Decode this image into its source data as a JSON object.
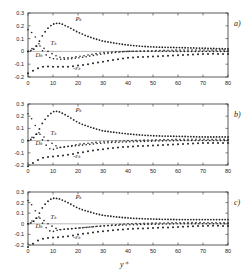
{
  "figure": {
    "xlabel": "y⁺",
    "x_ticks": [
      0,
      10,
      20,
      30,
      40,
      50,
      60,
      70,
      80
    ],
    "y_ticks": [
      0.3,
      0.2,
      0.1,
      0,
      -0.1,
      -0.2
    ],
    "y_tick_labels": [
      "0.3",
      "0.2",
      "0.1",
      "0",
      "-0.1",
      "-0.2"
    ]
  },
  "chart_data": [
    {
      "type": "line",
      "panel": "a)",
      "xlabel": "y+",
      "ylabel": "",
      "xlim": [
        0,
        80
      ],
      "ylim": [
        -0.2,
        0.3
      ],
      "grid": false,
      "annotations": [
        "P_k",
        "T_k",
        "D_k",
        "-ε_k"
      ],
      "series": [
        {
          "name": "P_k",
          "x": [
            0,
            3,
            6,
            9,
            12,
            15,
            20,
            25,
            30,
            40,
            50,
            60,
            70,
            80
          ],
          "values": [
            0.0,
            0.03,
            0.13,
            0.2,
            0.22,
            0.2,
            0.15,
            0.11,
            0.08,
            0.05,
            0.035,
            0.03,
            0.025,
            0.02
          ]
        },
        {
          "name": "T_k",
          "x": [
            0,
            3,
            5,
            8,
            12,
            15,
            20,
            30,
            40,
            60,
            80
          ],
          "values": [
            0.0,
            0.04,
            0.04,
            0.0,
            -0.04,
            -0.05,
            -0.04,
            -0.01,
            0.0,
            0.01,
            0.01
          ]
        },
        {
          "name": "D_k",
          "x": [
            0,
            3,
            6,
            9,
            12,
            15,
            20,
            30,
            40,
            60,
            80
          ],
          "values": [
            0.17,
            0.11,
            0.0,
            -0.05,
            -0.06,
            -0.06,
            -0.05,
            -0.02,
            0.0,
            0.0,
            0.0
          ]
        },
        {
          "name": "-ε_k",
          "x": [
            0,
            3,
            6,
            10,
            15,
            20,
            30,
            40,
            50,
            60,
            70,
            80
          ],
          "values": [
            -0.17,
            -0.14,
            -0.12,
            -0.12,
            -0.12,
            -0.11,
            -0.08,
            -0.05,
            -0.04,
            -0.03,
            -0.02,
            -0.02
          ]
        }
      ]
    },
    {
      "type": "line",
      "panel": "b)",
      "xlabel": "y+",
      "ylabel": "",
      "xlim": [
        0,
        80
      ],
      "ylim": [
        -0.2,
        0.3
      ],
      "grid": false,
      "annotations": [
        "P_k",
        "T_k",
        "D_k",
        "-ε_k"
      ],
      "series": [
        {
          "name": "P_k",
          "x": [
            0,
            3,
            6,
            9,
            11,
            14,
            20,
            25,
            30,
            40,
            50,
            60,
            70,
            80
          ],
          "values": [
            0.0,
            0.04,
            0.15,
            0.22,
            0.24,
            0.22,
            0.15,
            0.11,
            0.08,
            0.055,
            0.04,
            0.035,
            0.03,
            0.03
          ]
        },
        {
          "name": "T_k",
          "x": [
            0,
            3,
            5,
            8,
            12,
            15,
            20,
            30,
            40,
            60,
            80
          ],
          "values": [
            0.0,
            0.05,
            0.05,
            0.0,
            -0.05,
            -0.05,
            -0.03,
            -0.01,
            0.0,
            0.01,
            0.01
          ]
        },
        {
          "name": "D_k",
          "x": [
            0,
            3,
            6,
            9,
            12,
            15,
            20,
            30,
            40,
            60,
            80
          ],
          "values": [
            0.22,
            0.12,
            0.0,
            -0.07,
            -0.06,
            -0.05,
            -0.04,
            -0.02,
            -0.01,
            0.0,
            0.0
          ]
        },
        {
          "name": "-ε_k",
          "x": [
            0,
            3,
            6,
            10,
            15,
            20,
            30,
            40,
            50,
            60,
            70,
            80
          ],
          "values": [
            -0.21,
            -0.17,
            -0.14,
            -0.13,
            -0.12,
            -0.1,
            -0.07,
            -0.05,
            -0.04,
            -0.03,
            -0.02,
            -0.02
          ]
        }
      ]
    },
    {
      "type": "line",
      "panel": "c)",
      "xlabel": "y+",
      "ylabel": "",
      "xlim": [
        0,
        80
      ],
      "ylim": [
        -0.2,
        0.3
      ],
      "grid": false,
      "annotations": [
        "P_k",
        "T_k",
        "D_k",
        "-ε_k"
      ],
      "series": [
        {
          "name": "P_k",
          "x": [
            0,
            3,
            6,
            9,
            11,
            14,
            20,
            25,
            30,
            40,
            50,
            60,
            70,
            80
          ],
          "values": [
            0.0,
            0.04,
            0.16,
            0.23,
            0.24,
            0.22,
            0.15,
            0.11,
            0.08,
            0.055,
            0.045,
            0.04,
            0.04,
            0.04
          ]
        },
        {
          "name": "T_k",
          "x": [
            0,
            3,
            5,
            8,
            12,
            15,
            20,
            30,
            40,
            60,
            80
          ],
          "values": [
            0.0,
            0.05,
            0.05,
            0.0,
            -0.05,
            -0.05,
            -0.04,
            -0.02,
            0.0,
            0.01,
            0.01
          ]
        },
        {
          "name": "D_k",
          "x": [
            0,
            3,
            6,
            9,
            12,
            15,
            20,
            30,
            40,
            60,
            80
          ],
          "values": [
            0.22,
            0.12,
            0.0,
            -0.07,
            -0.06,
            -0.05,
            -0.04,
            -0.02,
            -0.01,
            0.0,
            0.0
          ]
        },
        {
          "name": "-ε_k",
          "x": [
            0,
            3,
            6,
            10,
            15,
            20,
            30,
            40,
            50,
            60,
            70,
            80
          ],
          "values": [
            -0.22,
            -0.17,
            -0.14,
            -0.13,
            -0.12,
            -0.1,
            -0.07,
            -0.05,
            -0.04,
            -0.03,
            -0.02,
            -0.02
          ]
        }
      ]
    }
  ],
  "panels": [
    {
      "label": "a)",
      "top": 13,
      "bottom": 77
    },
    {
      "label": "b)",
      "top": 104,
      "bottom": 165
    },
    {
      "label": "c)",
      "top": 192,
      "bottom": 245
    }
  ],
  "labels": {
    "P": "Pₖ",
    "T": "Tₖ",
    "D": "Dₖ",
    "E": "-εₖ"
  }
}
